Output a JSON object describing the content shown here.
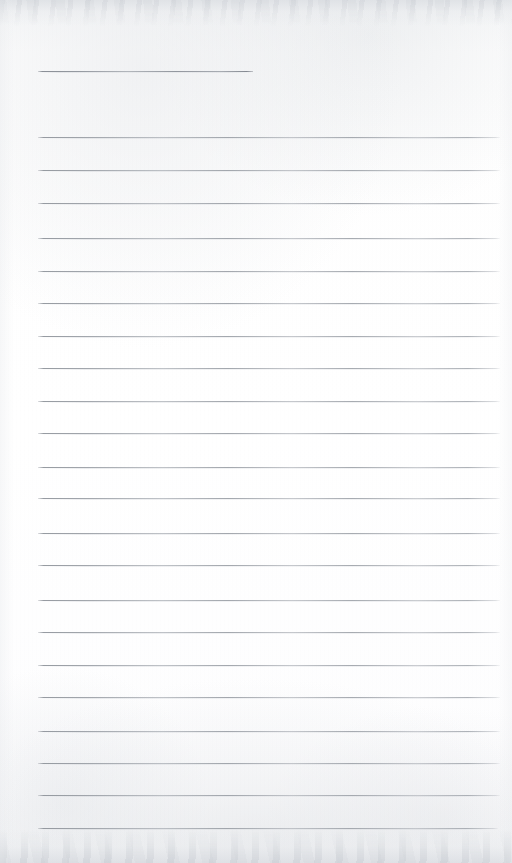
{
  "document": {
    "kind": "scanned-ruled-notebook-page",
    "title": "Blank Lined Notebook Page",
    "page_width": 512,
    "page_height": 863,
    "paper_color": "#fdfdfd",
    "rule_color": "#9aa0a7",
    "content_text": "",
    "has_handwriting": false,
    "has_printed_text": false
  },
  "layout": {
    "left_margin": 38,
    "right_edge": 500,
    "rule_thickness": 1,
    "rule_spacing": 32.4,
    "scan_edge_shading": {
      "top_band_height": 26,
      "bottom_band_height": 34
    }
  },
  "header_rule": {
    "label": "header-short-rule",
    "y": 71,
    "x_start": 38,
    "x_end": 253,
    "purpose": "name-or-date-line"
  },
  "rules": [
    {
      "index": 1,
      "y": 137,
      "x_start": 38,
      "x_end": 500
    },
    {
      "index": 2,
      "y": 170,
      "x_start": 38,
      "x_end": 500
    },
    {
      "index": 3,
      "y": 203,
      "x_start": 38,
      "x_end": 500
    },
    {
      "index": 4,
      "y": 238,
      "x_start": 38,
      "x_end": 500
    },
    {
      "index": 5,
      "y": 271,
      "x_start": 38,
      "x_end": 500
    },
    {
      "index": 6,
      "y": 303,
      "x_start": 38,
      "x_end": 500
    },
    {
      "index": 7,
      "y": 336,
      "x_start": 38,
      "x_end": 500
    },
    {
      "index": 8,
      "y": 368,
      "x_start": 38,
      "x_end": 500
    },
    {
      "index": 9,
      "y": 401,
      "x_start": 38,
      "x_end": 500
    },
    {
      "index": 10,
      "y": 433,
      "x_start": 38,
      "x_end": 500
    },
    {
      "index": 11,
      "y": 467,
      "x_start": 38,
      "x_end": 500
    },
    {
      "index": 12,
      "y": 498,
      "x_start": 38,
      "x_end": 500
    },
    {
      "index": 13,
      "y": 533,
      "x_start": 38,
      "x_end": 500
    },
    {
      "index": 14,
      "y": 565,
      "x_start": 38,
      "x_end": 500
    },
    {
      "index": 15,
      "y": 600,
      "x_start": 38,
      "x_end": 500
    },
    {
      "index": 16,
      "y": 632,
      "x_start": 38,
      "x_end": 500
    },
    {
      "index": 17,
      "y": 665,
      "x_start": 38,
      "x_end": 500
    },
    {
      "index": 18,
      "y": 697,
      "x_start": 38,
      "x_end": 500
    },
    {
      "index": 19,
      "y": 731,
      "x_start": 38,
      "x_end": 500
    },
    {
      "index": 20,
      "y": 763,
      "x_start": 38,
      "x_end": 500
    },
    {
      "index": 21,
      "y": 795,
      "x_start": 38,
      "x_end": 500
    },
    {
      "index": 22,
      "y": 828,
      "x_start": 38,
      "x_end": 498
    }
  ]
}
